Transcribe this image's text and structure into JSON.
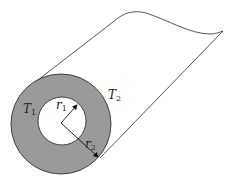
{
  "diagram": {
    "title": "",
    "labels": {
      "t1": {
        "base": "T",
        "sub": "1"
      },
      "t2": {
        "base": "T",
        "sub": "2"
      },
      "r1": {
        "base": "r",
        "sub": "1"
      },
      "r2": {
        "base": "r",
        "sub": "2"
      }
    },
    "colors": {
      "wall_fill": "#9a9a9a",
      "stroke": "#333333",
      "bore_fill": "#ffffff"
    },
    "geometry": {
      "center": [
        61,
        123
      ],
      "inner_radius": 24,
      "outer_radius": 50
    }
  }
}
